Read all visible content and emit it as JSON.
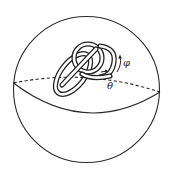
{
  "figure": {
    "labels": {
      "phi": "φ",
      "theta": "θ"
    },
    "colors": {
      "stroke": "#2a2a2a",
      "background": "#ffffff"
    }
  }
}
